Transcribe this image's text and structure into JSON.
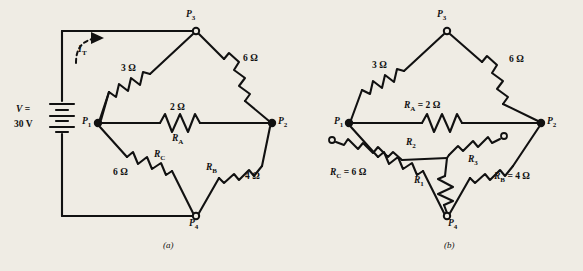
{
  "figure": {
    "background_color": "#efece4",
    "ink_color": "#111111",
    "panels": [
      {
        "id": "a",
        "caption": "(a)",
        "source": {
          "name": "battery",
          "line1": "V =",
          "line2": "30 V",
          "value": "30 V",
          "symbol": "battery-icon"
        },
        "current": {
          "label": "I",
          "subscript": "T",
          "arrow": "curved-dashed-arrow-icon"
        },
        "nodes": [
          {
            "name": "P",
            "sub": "3"
          },
          {
            "name": "P",
            "sub": "1"
          },
          {
            "name": "P",
            "sub": "2"
          },
          {
            "name": "P",
            "sub": "4"
          }
        ],
        "resistors": [
          {
            "id": "top-left",
            "value": "3 Ω",
            "name": ""
          },
          {
            "id": "top-right",
            "value": "6 Ω",
            "name": ""
          },
          {
            "id": "middle",
            "value": "2 Ω",
            "name": "R",
            "sub": "A"
          },
          {
            "id": "bottom-left",
            "value": "6 Ω",
            "name": "R",
            "sub": "C"
          },
          {
            "id": "bottom-right",
            "value": "4 Ω",
            "name": "R",
            "sub": "B"
          }
        ]
      },
      {
        "id": "b",
        "caption": "(b)",
        "nodes": [
          {
            "name": "P",
            "sub": "3"
          },
          {
            "name": "P",
            "sub": "1"
          },
          {
            "name": "P",
            "sub": "2"
          },
          {
            "name": "P",
            "sub": "4"
          }
        ],
        "resistors": [
          {
            "id": "top-left",
            "value": "3 Ω",
            "name": "",
            "label": "3 Ω"
          },
          {
            "id": "top-right",
            "value": "6 Ω",
            "name": "",
            "label": "6 Ω"
          },
          {
            "id": "middle",
            "value": "2 Ω",
            "name": "R",
            "sub": "A",
            "eq": "= 2 Ω"
          },
          {
            "id": "bottom-left",
            "value": "6 Ω",
            "name": "R",
            "sub": "C",
            "eq": "= 6 Ω"
          },
          {
            "id": "bottom-right",
            "value": "4 Ω",
            "name": "R",
            "sub": "B",
            "eq": "= 4 Ω"
          }
        ],
        "wye": [
          {
            "id": "wye-upper-left",
            "name": "R",
            "sub": "2"
          },
          {
            "id": "wye-upper-right",
            "name": "R",
            "sub": "3"
          },
          {
            "id": "wye-bottom",
            "name": "R",
            "sub": "1"
          }
        ]
      }
    ]
  },
  "text": {
    "ohm_3": "3 Ω",
    "ohm_6": "6 Ω",
    "ohm_6b": "6 Ω",
    "ohm_2": "2 Ω",
    "ohm_4": "4 Ω",
    "v_line1": "V =",
    "v_line2": "30 V",
    "cap_a": "(a)",
    "cap_b": "(b)",
    "ra_eq": "= 2 Ω",
    "rb_eq": "= 4 Ω",
    "rc_eq": "= 6 Ω",
    "b_3ohm": "3 Ω",
    "b_6ohm": "6 Ω"
  }
}
